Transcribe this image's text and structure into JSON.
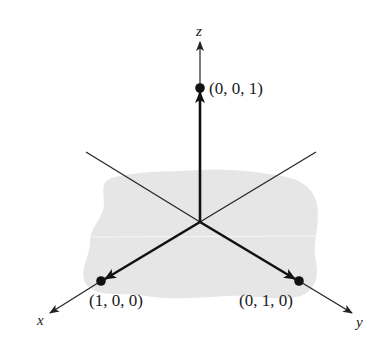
{
  "diagram": {
    "type": "3d-coordinate-axes",
    "axes": {
      "x": {
        "label": "x"
      },
      "y": {
        "label": "y"
      },
      "z": {
        "label": "z"
      }
    },
    "points": [
      {
        "id": "z-unit",
        "label": "(0, 0, 1)",
        "coords": [
          0,
          0,
          1
        ]
      },
      {
        "id": "x-unit",
        "label": "(1, 0, 0)",
        "coords": [
          1,
          0,
          0
        ]
      },
      {
        "id": "y-unit",
        "label": "(0, 1, 0)",
        "coords": [
          0,
          1,
          0
        ]
      }
    ],
    "colors": {
      "ink": "#111111",
      "plane": "#e6e6e6",
      "background": "#ffffff"
    }
  }
}
